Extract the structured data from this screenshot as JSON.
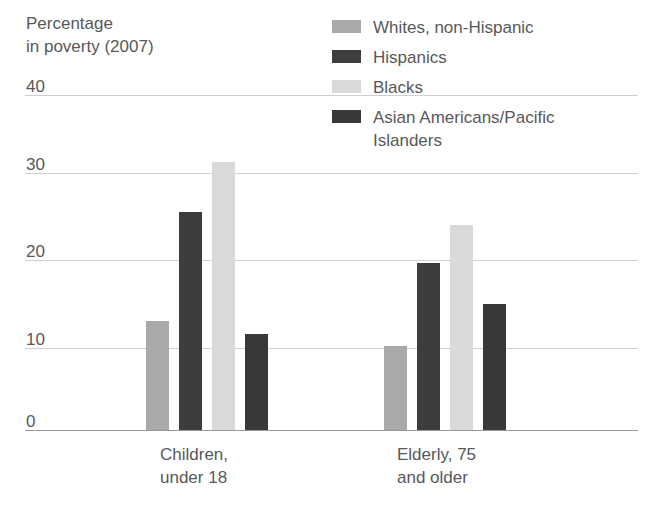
{
  "chart_data": {
    "type": "bar",
    "title": "Percentage\nin poverty (2007)",
    "xlabel": "",
    "ylabel": "Percentage in poverty (2007)",
    "ylim": [
      0,
      40
    ],
    "yticks": [
      0,
      10,
      20,
      30,
      40
    ],
    "ytick_labels": [
      "0",
      "10",
      "20",
      "30",
      "40"
    ],
    "grid": true,
    "legend_position": "top-right",
    "categories": [
      "Children,\nunder 18",
      "Elderly, 75\nand older"
    ],
    "series": [
      {
        "name": "Whites, non-Hispanic",
        "color": "#a9a9a9",
        "values": [
          13,
          10
        ]
      },
      {
        "name": "Hispanics",
        "color": "#3d3d3d",
        "values": [
          26,
          20
        ]
      },
      {
        "name": "Blacks",
        "color": "#d9d9d9",
        "values": [
          32,
          24.5
        ]
      },
      {
        "name": "Asian Americans/Pacific\nIslanders",
        "color": "#383838",
        "values": [
          11.5,
          15
        ]
      }
    ]
  },
  "axis": {
    "title": "Percentage\nin poverty (2007)",
    "ticks": [
      {
        "label": "40",
        "value": 40
      },
      {
        "label": "30",
        "value": 30
      },
      {
        "label": "20",
        "value": 20
      },
      {
        "label": "10",
        "value": 10
      },
      {
        "label": "0",
        "value": 0
      }
    ]
  },
  "categories": [
    {
      "label": "Children,\nunder 18"
    },
    {
      "label": "Elderly, 75\nand older"
    }
  ],
  "legend": {
    "items": [
      {
        "label": "Whites, non-Hispanic",
        "color": "#a9a9a9"
      },
      {
        "label": "Hispanics",
        "color": "#3d3d3d"
      },
      {
        "label": "Blacks",
        "color": "#d9d9d9"
      },
      {
        "label": "Asian Americans/Pacific\nIslanders",
        "color": "#383838"
      }
    ]
  },
  "colors": {
    "gridline": "#cfcfcf",
    "baseline": "#9a9a9a",
    "text": "#58585a",
    "background": "#ffffff"
  },
  "geometry": {
    "baseline_y": 430,
    "px_per_unit": 8.37,
    "grid_left": 25,
    "grid_width": 613,
    "bar_width": 23,
    "group1_x": [
      146,
      179,
      212,
      245
    ],
    "group2_x": [
      384,
      417,
      450,
      483
    ],
    "cat_label_x": [
      160,
      397
    ]
  }
}
